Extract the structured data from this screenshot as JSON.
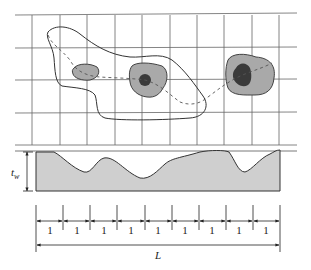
{
  "diagram": {
    "type": "weld-porosity-schematic",
    "plan_view": {
      "grid": {
        "vertical_lines_x": [
          32,
          60,
          87,
          115,
          142,
          170,
          197,
          224,
          252,
          279
        ],
        "horizontal_lines_y": [
          15,
          48,
          80,
          113,
          145
        ],
        "x_start": 15,
        "x_end": 297,
        "color": "#555555"
      },
      "blobs": [
        {
          "name": "small-blob-left",
          "fill": "#a9a9a9",
          "core": null
        },
        {
          "name": "blob-middle",
          "fill": "#a9a9a9",
          "core": {
            "fill": "#3a3a3a"
          }
        },
        {
          "name": "blob-right",
          "fill": "#a9a9a9",
          "core": {
            "fill": "#3a3a3a"
          }
        }
      ]
    },
    "profile_view": {
      "thickness_label": "t",
      "thickness_subscript": "w",
      "fill": "#cfcfcf",
      "stroke": "#333333"
    },
    "dimension": {
      "segment_label": "1",
      "segment_count": 9,
      "segment_labels": [
        "1",
        "1",
        "1",
        "1",
        "1",
        "1",
        "1",
        "1",
        "1"
      ],
      "total_label": "L"
    }
  }
}
